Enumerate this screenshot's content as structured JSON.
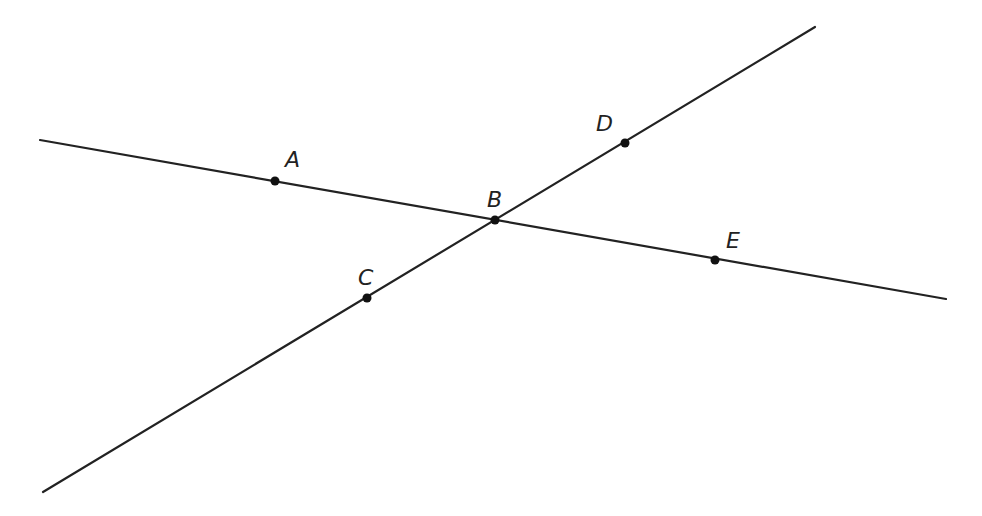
{
  "diagram": {
    "type": "intersecting-lines",
    "colors": {
      "line": "#222222",
      "point": "#111111",
      "background": "#ffffff"
    },
    "lines": [
      {
        "id": "line-AE",
        "x1": 40,
        "y1": 140,
        "x2": 946,
        "y2": 299,
        "passes_through": [
          "A",
          "B",
          "E"
        ]
      },
      {
        "id": "line-CD",
        "x1": 43,
        "y1": 492,
        "x2": 815,
        "y2": 27,
        "passes_through": [
          "C",
          "B",
          "D"
        ]
      }
    ],
    "points": [
      {
        "name": "A",
        "x": 275,
        "y": 181,
        "label_x": 285,
        "label_y": 167
      },
      {
        "name": "B",
        "x": 495,
        "y": 220,
        "label_x": 487,
        "label_y": 207
      },
      {
        "name": "C",
        "x": 367,
        "y": 298,
        "label_x": 358,
        "label_y": 285
      },
      {
        "name": "D",
        "x": 625,
        "y": 143,
        "label_x": 596,
        "label_y": 131
      },
      {
        "name": "E",
        "x": 715,
        "y": 260,
        "label_x": 726,
        "label_y": 248
      }
    ]
  }
}
